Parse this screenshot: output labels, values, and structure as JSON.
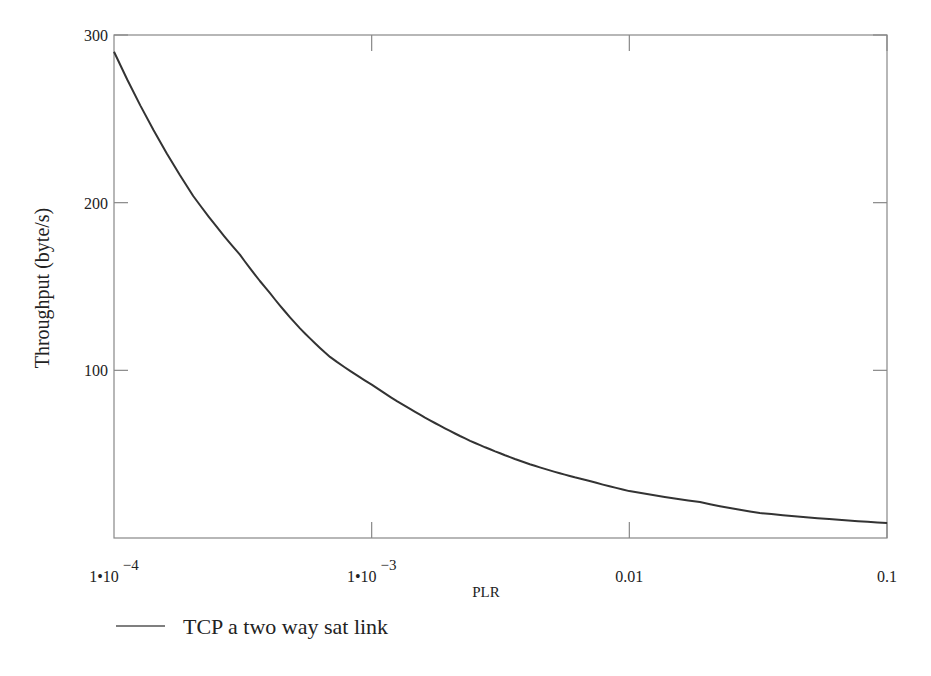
{
  "chart_data": {
    "type": "line",
    "title": "",
    "xlabel": "PLR",
    "ylabel": "Throughput  (byte/s)",
    "xscale": "log",
    "xlim": [
      0.0001,
      0.1
    ],
    "ylim": [
      0,
      300
    ],
    "grid": false,
    "legend_position": "bottom-left",
    "x_ticks": [
      {
        "value": 0.0001,
        "label_base": "1•10",
        "label_exp": "−4"
      },
      {
        "value": 0.001,
        "label_base": "1•10",
        "label_exp": "−3"
      },
      {
        "value": 0.01,
        "label_base": "0.01",
        "label_exp": ""
      },
      {
        "value": 0.1,
        "label_base": "0.1",
        "label_exp": ""
      }
    ],
    "y_ticks": [
      {
        "value": 100,
        "label": "100"
      },
      {
        "value": 200,
        "label": "200"
      },
      {
        "value": 300,
        "label": "300"
      }
    ],
    "series": [
      {
        "name": "TCP a two way sat link",
        "color": "#333333",
        "x": [
          0.0001,
          0.000203,
          0.000308,
          0.000403,
          0.000527,
          0.000689,
          0.001,
          0.00141,
          0.00184,
          0.00241,
          0.00315,
          0.00411,
          0.00537,
          0.00702,
          0.01,
          0.0188,
          0.0321,
          0.0596,
          0.1
        ],
        "values": [
          290,
          204,
          169,
          146,
          125,
          108,
          91.5,
          77,
          67,
          58,
          50.5,
          44,
          38.6,
          34,
          28,
          21.4,
          14.9,
          11.3,
          8.9
        ]
      }
    ]
  },
  "colors": {
    "axis": "#888888",
    "line": "#333333",
    "background": "#ffffff"
  }
}
